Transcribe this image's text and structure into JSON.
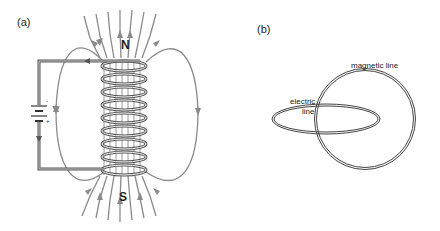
{
  "panel_a": {
    "label": "(a)",
    "north_label": "N",
    "south_label": "S",
    "battery_minus": "-",
    "battery_plus": "+",
    "coil_turns": 9
  },
  "panel_b": {
    "label": "(b)",
    "magnetic_label": "magnetic line",
    "electric_label_1": "electric",
    "electric_label_2": "line"
  },
  "colors": {
    "field_line": "#8a8a8a",
    "wire": "#555555",
    "loop": "#444444",
    "text": "#222222"
  }
}
